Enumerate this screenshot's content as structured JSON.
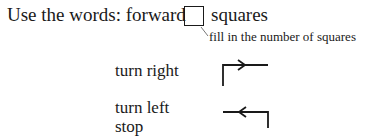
{
  "instruction": {
    "prefix": "Use the words:",
    "word_forward": "forward",
    "word_squares": "squares",
    "annotation": "fill in the number of squares"
  },
  "commands": [
    {
      "label": "turn right",
      "icon": "turn-right-arrow-icon"
    },
    {
      "label": "turn left",
      "icon": "turn-left-arrow-icon"
    },
    {
      "label": "stop",
      "icon": null
    }
  ]
}
